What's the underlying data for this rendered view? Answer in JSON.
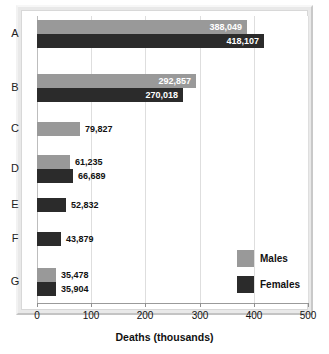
{
  "chart_data": {
    "type": "bar",
    "orientation": "horizontal",
    "title": "",
    "xlabel": "Deaths (thousands)",
    "ylabel": "",
    "xlim": [
      0,
      500
    ],
    "xticks": [
      0,
      100,
      200,
      300,
      400,
      500
    ],
    "xtick_labels": [
      "0",
      "100",
      "200",
      "300",
      "400",
      "500"
    ],
    "grid": true,
    "grid_axis": "x",
    "legend_position": "lower-right",
    "categories": [
      "A",
      "B",
      "C",
      "D",
      "E",
      "F",
      "G"
    ],
    "series": [
      {
        "name": "Males",
        "color": "#999999",
        "values": [
          388049,
          292857,
          79827,
          61235,
          null,
          null,
          35478
        ],
        "value_labels": [
          "388,049",
          "292,857",
          "79,827",
          "61,235",
          "",
          "",
          "35,478"
        ]
      },
      {
        "name": "Females",
        "color": "#2b2b2b",
        "values": [
          418107,
          270018,
          null,
          66689,
          52832,
          43879,
          35904
        ],
        "value_labels": [
          "418,107",
          "270,018",
          "",
          "66,689",
          "52,832",
          "43,879",
          "35,904"
        ]
      }
    ]
  },
  "legend": {
    "items": [
      {
        "label": "Males",
        "color": "#999999"
      },
      {
        "label": "Females",
        "color": "#2b2b2b"
      }
    ]
  },
  "axis": {
    "x_title": "Deaths (thousands)"
  }
}
